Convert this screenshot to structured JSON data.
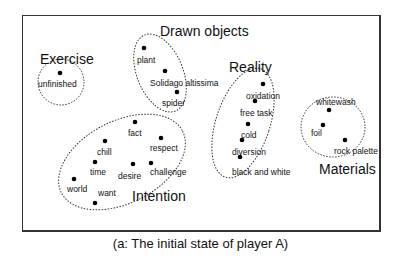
{
  "caption": "(a: The initial state of player A)",
  "categories": [
    {
      "name": "Exercise",
      "x": 40,
      "y": 52
    },
    {
      "name": "Drawn objects",
      "x": 160,
      "y": 24
    },
    {
      "name": "Reality",
      "x": 229,
      "y": 60
    },
    {
      "name": "Materials",
      "x": 319,
      "y": 162
    },
    {
      "name": "Intention",
      "x": 132,
      "y": 189
    }
  ],
  "words": [
    {
      "text": "unfinished",
      "dot": [
        60,
        73
      ],
      "x": 38,
      "y": 80
    },
    {
      "text": "plant",
      "dot": [
        144,
        48
      ],
      "x": 137,
      "y": 56
    },
    {
      "text": "Solidago altissima",
      "dot": [
        165,
        71
      ],
      "x": 150,
      "y": 79
    },
    {
      "text": "spider",
      "dot": [
        177,
        92
      ],
      "x": 162,
      "y": 99
    },
    {
      "text": "oxidation",
      "dot": [
        263,
        84
      ],
      "x": 246,
      "y": 92
    },
    {
      "text": "free task",
      "dot": [
        255,
        101
      ],
      "x": 240,
      "y": 109
    },
    {
      "text": "cold",
      "dot": [
        248,
        124
      ],
      "x": 241,
      "y": 131
    },
    {
      "text": "diversion",
      "dot": [
        242,
        140
      ],
      "x": 232,
      "y": 148
    },
    {
      "text": "black and white",
      "dot": [
        240,
        157
      ],
      "x": 232,
      "y": 168
    },
    {
      "text": "whitewash",
      "dot": [
        329,
        110
      ],
      "x": 316,
      "y": 98
    },
    {
      "text": "foil",
      "dot": [
        323,
        125
      ],
      "x": 311,
      "y": 129
    },
    {
      "text": "rock palette",
      "dot": [
        345,
        140
      ],
      "x": 334,
      "y": 147
    },
    {
      "text": "fact",
      "dot": [
        135,
        122
      ],
      "x": 128,
      "y": 129
    },
    {
      "text": "chill",
      "dot": [
        105,
        141
      ],
      "x": 97,
      "y": 148
    },
    {
      "text": "respect",
      "dot": [
        161,
        138
      ],
      "x": 150,
      "y": 144
    },
    {
      "text": "time",
      "dot": [
        95,
        162
      ],
      "x": 90,
      "y": 168
    },
    {
      "text": "desire",
      "dot": [
        133,
        164
      ],
      "x": 118,
      "y": 172
    },
    {
      "text": "challenge",
      "dot": [
        151,
        163
      ],
      "x": 150,
      "y": 168
    },
    {
      "text": "world",
      "dot": [
        74,
        179
      ],
      "x": 67,
      "y": 185
    },
    {
      "text": "want",
      "dot": [
        95,
        203
      ],
      "x": 98,
      "y": 189
    }
  ]
}
